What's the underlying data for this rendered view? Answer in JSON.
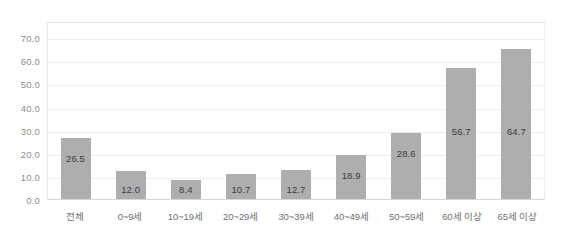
{
  "chart_data": {
    "type": "bar",
    "title": "",
    "subtitle": "",
    "xlabel": "",
    "ylabel": "",
    "categories": [
      "전체",
      "0~9세",
      "10~19세",
      "20~29세",
      "30~39세",
      "40~49세",
      "50~59세",
      "60세 이상",
      "65세 이상"
    ],
    "values": [
      26.5,
      12.0,
      8.4,
      10.7,
      12.7,
      18.9,
      28.6,
      56.7,
      64.7
    ],
    "value_labels": [
      "26.5",
      "12.0",
      "8.4",
      "10.7",
      "12.7",
      "18.9",
      "28.6",
      "56.7",
      "64.7"
    ],
    "ylim": [
      0.0,
      77.0
    ],
    "yticks": [
      0.0,
      10.0,
      20.0,
      30.0,
      40.0,
      50.0,
      60.0,
      70.0
    ],
    "ytick_labels": [
      "0.0",
      "10.0",
      "20.0",
      "30.0",
      "40.0",
      "50.0",
      "60.0",
      "70.0"
    ],
    "grid": true,
    "legend": false,
    "legend_position": "none",
    "bar_color": "#aeaeae",
    "gridline_color": "#ededef",
    "label_color": "#3b3b3b",
    "tick_color": "#8d8d8d",
    "category_color": "#6f6f6f"
  }
}
